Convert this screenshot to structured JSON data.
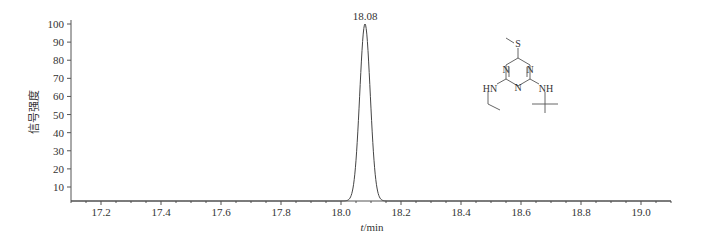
{
  "chart_data": {
    "type": "line",
    "title": "",
    "xlabel": "t/min",
    "ylabel": "信号强度",
    "xlim": [
      17.1,
      19.1
    ],
    "ylim": [
      3,
      100
    ],
    "x_ticks": [
      "17.2",
      "17.4",
      "17.6",
      "17.8",
      "18.0",
      "18.2",
      "18.4",
      "18.6",
      "18.8",
      "19.0"
    ],
    "y_ticks": [
      "10",
      "20",
      "30",
      "40",
      "50",
      "60",
      "70",
      "80",
      "90",
      "100"
    ],
    "grid": false,
    "legend": null,
    "series": [
      {
        "name": "chromatogram",
        "x": [
          17.1,
          18.04,
          18.05,
          18.06,
          18.07,
          18.08,
          18.09,
          18.1,
          18.11,
          18.12,
          19.1
        ],
        "y": [
          0,
          0,
          10,
          45,
          85,
          100,
          85,
          45,
          10,
          0,
          0
        ]
      }
    ],
    "annotations": [
      {
        "text": "18.08",
        "x": 18.08,
        "y": 100,
        "type": "peak-label"
      }
    ],
    "structure_labels": [
      "S",
      "N",
      "N",
      "N",
      "HN",
      "NH"
    ]
  }
}
